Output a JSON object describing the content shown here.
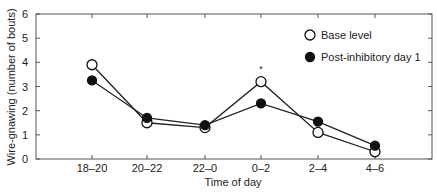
{
  "chart_data": {
    "type": "line",
    "title": "",
    "xlabel": "Time of day",
    "ylabel": "Wire-gnawing (number of bouts)",
    "categories": [
      "18–20",
      "20–22",
      "22–0",
      "0–2",
      "2–4",
      "4–6"
    ],
    "ylim": [
      0,
      6
    ],
    "yticks": [
      0,
      1,
      2,
      3,
      4,
      5,
      6
    ],
    "grid": false,
    "legend_position": "upper right",
    "series": [
      {
        "name": "Base level",
        "marker": "open-circle",
        "values": [
          3.9,
          1.5,
          1.3,
          3.2,
          1.1,
          0.3
        ]
      },
      {
        "name": "Post-inhibitory day 1",
        "marker": "filled-circle",
        "values": [
          3.25,
          1.7,
          1.4,
          2.3,
          1.55,
          0.55
        ]
      }
    ],
    "annotations": [
      {
        "text": "*",
        "category": "0–2",
        "y": 3.85
      }
    ]
  }
}
